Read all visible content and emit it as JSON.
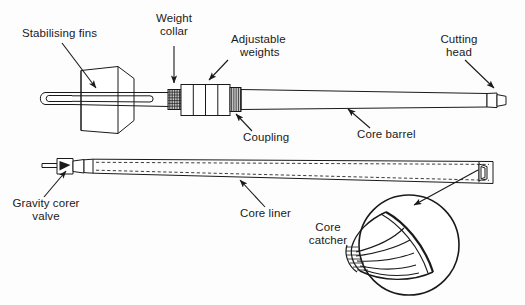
{
  "figure": {
    "background_color": "#fdfdfd",
    "line_color": "#1a1a1a",
    "fill_color": "#ffffff"
  },
  "labels": {
    "stabilising_fins": "Stabilising fins",
    "weight_collar_line1": "Weight",
    "weight_collar_line2": "collar",
    "adjustable_weights_line1": "Adjustable",
    "adjustable_weights_line2": "weights",
    "cutting_head_line1": "Cutting",
    "cutting_head_line2": "head",
    "coupling": "Coupling",
    "core_barrel": "Core barrel",
    "gravity_corer_valve_line1": "Gravity corer",
    "gravity_corer_valve_line2": "valve",
    "core_liner": "Core liner",
    "core_catcher_line1": "Core",
    "core_catcher_line2": "catcher"
  },
  "parts": [
    {
      "name": "stabilising-fins",
      "label": "Stabilising fins"
    },
    {
      "name": "weight-collar",
      "label": "Weight collar"
    },
    {
      "name": "adjustable-weights",
      "label": "Adjustable weights"
    },
    {
      "name": "coupling",
      "label": "Coupling"
    },
    {
      "name": "core-barrel",
      "label": "Core barrel"
    },
    {
      "name": "cutting-head",
      "label": "Cutting head"
    },
    {
      "name": "gravity-corer-valve",
      "label": "Gravity corer valve"
    },
    {
      "name": "core-liner",
      "label": "Core liner"
    },
    {
      "name": "core-catcher",
      "label": "Core catcher"
    }
  ]
}
